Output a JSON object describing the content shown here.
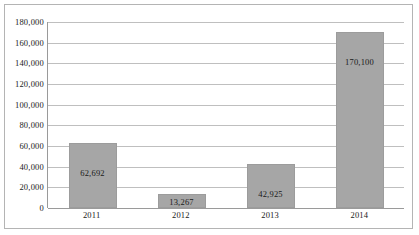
{
  "chart_data": {
    "type": "bar",
    "title": "",
    "xlabel": "",
    "ylabel": "",
    "categories": [
      "2011",
      "2012",
      "2013",
      "2014"
    ],
    "values": [
      62692,
      13267,
      42925,
      170100
    ],
    "value_labels": [
      "62,692",
      "13,267",
      "42,925",
      "170,100"
    ],
    "ylim": [
      0,
      180000
    ],
    "ytick_step": 20000,
    "ytick_labels": [
      "180,000",
      "160,000",
      "140,000",
      "120,000",
      "100,000",
      "80,000",
      "60,000",
      "40,000",
      "20,000",
      "0"
    ],
    "ytick_values": [
      180000,
      160000,
      140000,
      120000,
      100000,
      80000,
      60000,
      40000,
      20000,
      0
    ],
    "grid": true,
    "legend": false,
    "legend_position": "none",
    "bar_color": "#a6a6a6",
    "gridline_color": "#bfbfbf",
    "axis_color": "#9a9a9a",
    "border_color": "#b4b4b4",
    "background_color": "#ffffff",
    "label_color": "#1a1a1a",
    "data_label_position": "inside"
  }
}
